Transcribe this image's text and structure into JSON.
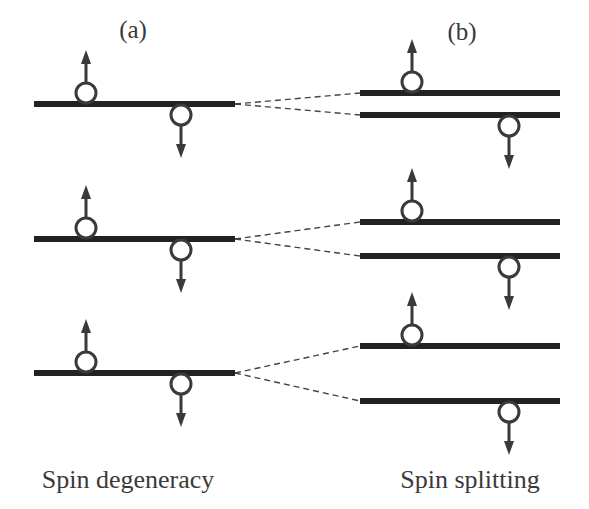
{
  "panels": {
    "a": {
      "label": "(a)",
      "caption": "Spin degeneracy"
    },
    "b": {
      "label": "(b)",
      "caption": "Spin splitting"
    }
  },
  "levels": [
    {
      "id": "level-1",
      "degenerate_electrons": [
        "up",
        "down"
      ],
      "split": {
        "upper": "up",
        "lower": "down",
        "splitting": "small"
      }
    },
    {
      "id": "level-2",
      "degenerate_electrons": [
        "up",
        "down"
      ],
      "split": {
        "upper": "up",
        "lower": "down",
        "splitting": "medium"
      }
    },
    {
      "id": "level-3",
      "degenerate_electrons": [
        "up",
        "down"
      ],
      "split": {
        "upper": "up",
        "lower": "down",
        "splitting": "large"
      }
    }
  ],
  "colors": {
    "level": "#222222",
    "electron_stroke": "#3a3a3a",
    "text": "#3a3a3a",
    "background": "#ffffff"
  }
}
